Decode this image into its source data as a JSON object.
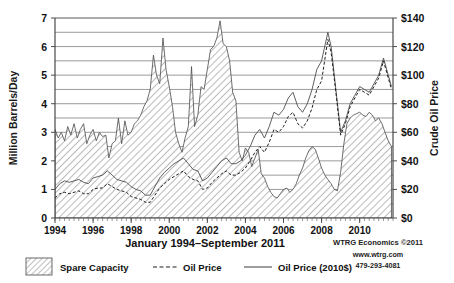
{
  "chart_data": {
    "type": "area",
    "title": "",
    "subtitle": "",
    "xlabel": "January 1994–September 2011",
    "ylabel": "Million Barrels/Day",
    "y2label": "Crude Oil Price",
    "xlim": [
      1994,
      2011.75
    ],
    "ylim": [
      0,
      7
    ],
    "y2lim": [
      0,
      140
    ],
    "grid": true,
    "legend_position": "bottom",
    "y_ticks": [
      0,
      1,
      2,
      3,
      4,
      5,
      6,
      7
    ],
    "y_tick_labels": [
      "0",
      "1",
      "2",
      "3",
      "4",
      "5",
      "6",
      "7"
    ],
    "y_minor_step": 0.5,
    "y2_ticks": [
      0,
      20,
      40,
      60,
      80,
      100,
      120,
      140
    ],
    "y2_tick_labels": [
      "$0",
      "$20",
      "$40",
      "$60",
      "$80",
      "$100",
      "$120",
      "$140"
    ],
    "x_ticks": [
      1994,
      1996,
      1998,
      2000,
      2002,
      2004,
      2006,
      2008,
      2010
    ],
    "x_tick_labels": [
      "1994",
      "1996",
      "1998",
      "2000",
      "2002",
      "2004",
      "2006",
      "2008",
      "2010"
    ],
    "x_minor_step_months": 3,
    "legend": [
      {
        "label": "Spare Capacity",
        "marker": "hatched-swatch"
      },
      {
        "label": "Oil Price",
        "marker": "dashed-line"
      },
      {
        "label": "Oil Price (2010$)",
        "marker": "solid-line"
      }
    ],
    "series": [
      {
        "name": "Spare Capacity",
        "unit": "Million Barrels/Day",
        "axis": "left",
        "type": "area",
        "x": [
          1994.0,
          1994.17,
          1994.33,
          1994.5,
          1994.67,
          1994.83,
          1995.0,
          1995.17,
          1995.33,
          1995.5,
          1995.67,
          1995.83,
          1996.0,
          1996.17,
          1996.33,
          1996.5,
          1996.67,
          1996.83,
          1997.0,
          1997.17,
          1997.33,
          1997.5,
          1997.67,
          1997.83,
          1998.0,
          1998.17,
          1998.33,
          1998.5,
          1998.67,
          1998.83,
          1999.0,
          1999.17,
          1999.33,
          1999.5,
          1999.67,
          1999.83,
          2000.0,
          2000.17,
          2000.33,
          2000.5,
          2000.67,
          2000.83,
          2001.0,
          2001.17,
          2001.33,
          2001.5,
          2001.67,
          2001.83,
          2002.0,
          2002.17,
          2002.33,
          2002.5,
          2002.67,
          2002.83,
          2003.0,
          2003.17,
          2003.33,
          2003.5,
          2003.67,
          2003.83,
          2004.0,
          2004.17,
          2004.33,
          2004.5,
          2004.67,
          2004.83,
          2005.0,
          2005.17,
          2005.33,
          2005.5,
          2005.67,
          2005.83,
          2006.0,
          2006.17,
          2006.33,
          2006.5,
          2006.67,
          2006.83,
          2007.0,
          2007.17,
          2007.33,
          2007.5,
          2007.67,
          2007.83,
          2008.0,
          2008.17,
          2008.33,
          2008.5,
          2008.67,
          2008.83,
          2009.0,
          2009.17,
          2009.33,
          2009.5,
          2009.67,
          2009.83,
          2010.0,
          2010.17,
          2010.33,
          2010.5,
          2010.67,
          2010.83,
          2011.0,
          2011.17,
          2011.33,
          2011.5,
          2011.67
        ],
        "values": [
          3.1,
          2.8,
          3.0,
          2.7,
          3.2,
          2.9,
          3.3,
          2.8,
          3.1,
          3.3,
          2.6,
          2.9,
          3.1,
          2.7,
          3.0,
          2.85,
          2.9,
          2.1,
          2.6,
          2.7,
          3.5,
          2.6,
          3.4,
          2.9,
          3.0,
          3.3,
          3.4,
          3.6,
          3.9,
          4.1,
          4.5,
          5.7,
          5.0,
          4.7,
          6.3,
          5.2,
          4.6,
          3.9,
          3.0,
          2.6,
          2.3,
          2.8,
          3.2,
          5.3,
          3.2,
          3.6,
          4.6,
          4.5,
          5.2,
          5.9,
          6.0,
          6.3,
          6.9,
          6.1,
          6.0,
          5.5,
          4.4,
          4.1,
          2.3,
          2.0,
          2.45,
          2.3,
          1.8,
          2.1,
          2.4,
          1.55,
          1.4,
          1.1,
          0.9,
          0.75,
          0.7,
          0.85,
          1.0,
          1.05,
          0.9,
          1.0,
          1.2,
          1.5,
          1.75,
          2.1,
          2.35,
          2.5,
          2.4,
          2.1,
          1.75,
          1.5,
          1.35,
          1.2,
          1.0,
          0.95,
          1.6,
          2.6,
          3.3,
          3.5,
          3.6,
          3.65,
          3.7,
          3.6,
          3.55,
          3.7,
          3.6,
          3.4,
          3.5,
          3.3,
          3.0,
          2.7,
          2.5
        ]
      },
      {
        "name": "Oil Price (2010$)",
        "unit": "Crude Oil Price (2010 dollars)",
        "axis": "right",
        "type": "line",
        "x": [
          1994.0,
          1994.25,
          1994.5,
          1994.75,
          1995.0,
          1995.25,
          1995.5,
          1995.75,
          1996.0,
          1996.25,
          1996.5,
          1996.75,
          1997.0,
          1997.25,
          1997.5,
          1997.75,
          1998.0,
          1998.25,
          1998.5,
          1998.75,
          1999.0,
          1999.25,
          1999.5,
          1999.75,
          2000.0,
          2000.25,
          2000.5,
          2000.75,
          2001.0,
          2001.25,
          2001.5,
          2001.75,
          2002.0,
          2002.25,
          2002.5,
          2002.75,
          2003.0,
          2003.25,
          2003.5,
          2003.75,
          2004.0,
          2004.25,
          2004.5,
          2004.75,
          2005.0,
          2005.25,
          2005.5,
          2005.75,
          2006.0,
          2006.25,
          2006.5,
          2006.75,
          2007.0,
          2007.25,
          2007.5,
          2007.75,
          2008.0,
          2008.33,
          2008.5,
          2008.75,
          2009.0,
          2009.25,
          2009.5,
          2009.75,
          2010.0,
          2010.25,
          2010.5,
          2010.75,
          2011.0,
          2011.25,
          2011.5,
          2011.67
        ],
        "values": [
          20,
          24,
          26,
          25,
          26,
          27,
          25,
          24,
          28,
          29,
          30,
          33,
          30,
          27,
          26,
          25,
          22,
          20,
          19,
          16,
          16,
          22,
          28,
          32,
          35,
          38,
          40,
          42,
          38,
          34,
          33,
          26,
          28,
          32,
          36,
          40,
          42,
          38,
          38,
          40,
          44,
          50,
          58,
          62,
          56,
          64,
          74,
          72,
          76,
          84,
          88,
          78,
          74,
          80,
          90,
          104,
          110,
          130,
          120,
          90,
          60,
          68,
          80,
          86,
          92,
          90,
          88,
          94,
          100,
          112,
          100,
          92
        ]
      },
      {
        "name": "Oil Price",
        "unit": "Crude Oil Price (nominal dollars)",
        "axis": "right",
        "type": "line",
        "x": [
          1994.0,
          1994.25,
          1994.5,
          1994.75,
          1995.0,
          1995.25,
          1995.5,
          1995.75,
          1996.0,
          1996.25,
          1996.5,
          1996.75,
          1997.0,
          1997.25,
          1997.5,
          1997.75,
          1998.0,
          1998.25,
          1998.5,
          1998.75,
          1999.0,
          1999.25,
          1999.5,
          1999.75,
          2000.0,
          2000.25,
          2000.5,
          2000.75,
          2001.0,
          2001.25,
          2001.5,
          2001.75,
          2002.0,
          2002.25,
          2002.5,
          2002.75,
          2003.0,
          2003.25,
          2003.5,
          2003.75,
          2004.0,
          2004.25,
          2004.5,
          2004.75,
          2005.0,
          2005.25,
          2005.5,
          2005.75,
          2006.0,
          2006.25,
          2006.5,
          2006.75,
          2007.0,
          2007.25,
          2007.5,
          2007.75,
          2008.0,
          2008.33,
          2008.5,
          2008.75,
          2009.0,
          2009.25,
          2009.5,
          2009.75,
          2010.0,
          2010.25,
          2010.5,
          2010.75,
          2011.0,
          2011.25,
          2011.5,
          2011.67
        ],
        "values": [
          14,
          17,
          18,
          17,
          18,
          19,
          17,
          17,
          20,
          21,
          21,
          24,
          22,
          20,
          19,
          18,
          15,
          14,
          13,
          11,
          11,
          16,
          21,
          24,
          27,
          29,
          31,
          33,
          29,
          27,
          26,
          20,
          21,
          25,
          28,
          31,
          33,
          30,
          30,
          32,
          35,
          40,
          46,
          50,
          46,
          53,
          62,
          60,
          64,
          71,
          74,
          66,
          63,
          68,
          77,
          90,
          96,
          125,
          116,
          88,
          58,
          66,
          78,
          84,
          90,
          88,
          86,
          92,
          98,
          110,
          98,
          90
        ]
      }
    ]
  },
  "footer": {
    "caption": "January 1994–September 2011",
    "credits": [
      "WTRG Economics ©2011",
      "www.wtrg.com",
      "479-293-4081"
    ]
  }
}
